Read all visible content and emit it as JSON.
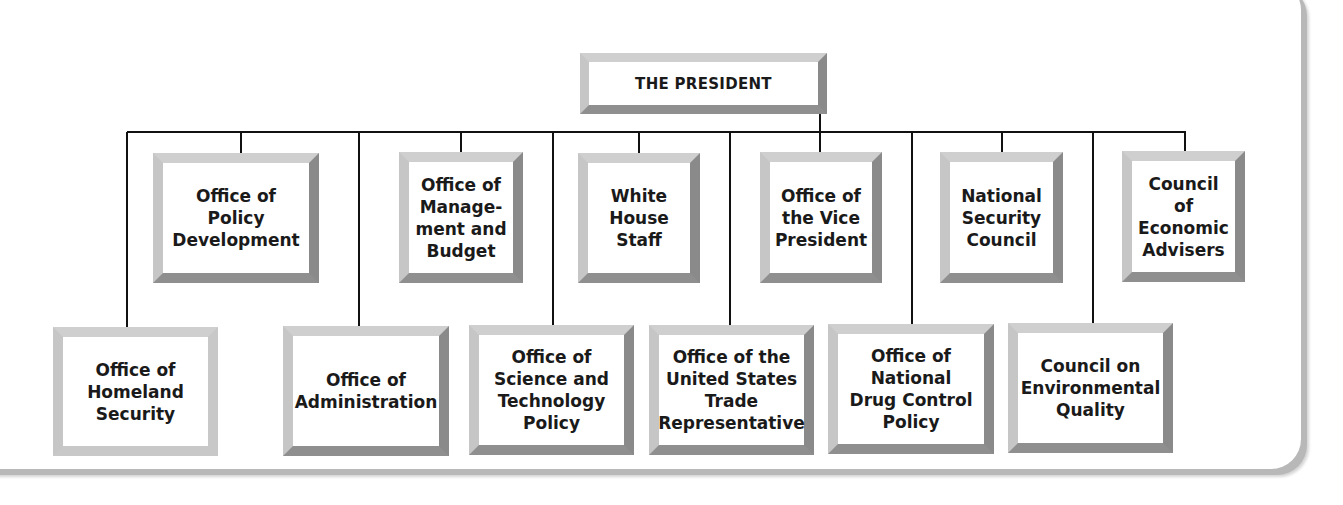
{
  "diagram": {
    "type": "org-chart",
    "root": {
      "id": "president",
      "label": "THE PRESIDENT"
    },
    "top_row": [
      {
        "id": "policy-development",
        "label": "Office of\nPolicy\nDevelopment"
      },
      {
        "id": "omb",
        "label": "Office of\nManage-\nment and\nBudget"
      },
      {
        "id": "white-house-staff",
        "label": "White\nHouse\nStaff"
      },
      {
        "id": "vice-president",
        "label": "Office of\nthe Vice\nPresident"
      },
      {
        "id": "nsc",
        "label": "National\nSecurity\nCouncil"
      },
      {
        "id": "cea",
        "label": "Council of\nEconomic\nAdvisers"
      }
    ],
    "bottom_row": [
      {
        "id": "homeland-security",
        "label": "Office of\nHomeland\nSecurity"
      },
      {
        "id": "administration",
        "label": "Office of\nAdministration"
      },
      {
        "id": "ostp",
        "label": "Office of\nScience and\nTechnology\nPolicy"
      },
      {
        "id": "ustr",
        "label": "Office of the\nUnited States\nTrade\nRepresentative"
      },
      {
        "id": "ondcp",
        "label": "Office of\nNational\nDrug Control\nPolicy"
      },
      {
        "id": "ceq",
        "label": "Council on\nEnvironmental\nQuality"
      }
    ],
    "edges": "All offices connect to THE PRESIDENT via a single horizontal bus line"
  }
}
